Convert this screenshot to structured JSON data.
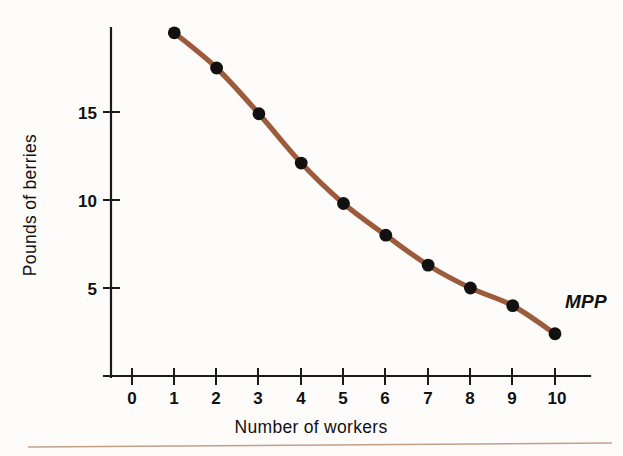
{
  "chart_data": {
    "type": "line",
    "title": "",
    "subtitle": "",
    "xlabel": "Number of workers",
    "ylabel": "Pounds of berries",
    "x": [
      1,
      2,
      3,
      4,
      5,
      6,
      7,
      8,
      9,
      10
    ],
    "values": [
      19.5,
      17.5,
      14.9,
      12.1,
      9.8,
      8.0,
      6.3,
      5.0,
      4.0,
      2.4
    ],
    "series": [
      {
        "name": "MPP",
        "values": [
          19.5,
          17.5,
          14.9,
          12.1,
          9.8,
          8.0,
          6.3,
          5.0,
          4.0,
          2.4
        ]
      }
    ],
    "x_tick_labels": [
      "0",
      "1",
      "2",
      "3",
      "4",
      "5",
      "6",
      "7",
      "8",
      "9",
      "10"
    ],
    "x_tick_values": [
      0,
      1,
      2,
      3,
      4,
      5,
      6,
      7,
      8,
      9,
      10
    ],
    "y_tick_labels": [
      "5",
      "10",
      "15"
    ],
    "y_tick_values": [
      5,
      10,
      15
    ],
    "xlim": [
      -0.7,
      10.6
    ],
    "ylim": [
      0,
      20.6
    ],
    "grid": false,
    "legend": "none",
    "annotations": [
      {
        "text": "MPP",
        "x": 10.1,
        "y": 4.3,
        "style": "italic"
      }
    ],
    "line_color": "#9c5c3c",
    "marker_color": "#111111",
    "axis_color": "#1a1a1a",
    "background_color": "#fdfcfa",
    "rule_color": "#c4a08a"
  },
  "axes": {
    "x_title": "Number of workers",
    "y_title": "Pounds of berries"
  },
  "annotation": {
    "mpp_label": "MPP"
  },
  "ticks": {
    "x": [
      "0",
      "1",
      "2",
      "3",
      "4",
      "5",
      "6",
      "7",
      "8",
      "9",
      "10"
    ],
    "y": [
      "15",
      "10",
      "5"
    ]
  }
}
